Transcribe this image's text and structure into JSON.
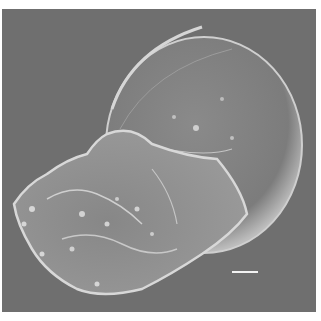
{
  "image": {
    "type": "SEM micrograph",
    "subject": "globular cell with ruffled, blebbing lower body",
    "background_color": "#6f6f6f",
    "specimen_color": "#8a8a8a",
    "highlight_color": "#d8d8d8"
  },
  "scale_bar": {
    "label": "",
    "color": "#f2f2f2"
  }
}
